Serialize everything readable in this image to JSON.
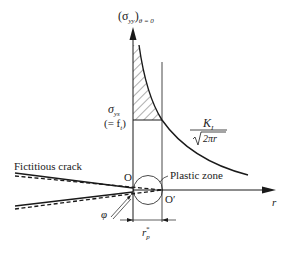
{
  "diagram": {
    "y_axis_label": {
      "main": "(σ",
      "sub_yy": "yy",
      "close": ")",
      "sub_theta": "θ = 0"
    },
    "x_axis_label": "r",
    "yield_stress": {
      "symbol": "σ",
      "sub": "ys",
      "equiv_open": "(= f",
      "equiv_sub": "t",
      "equiv_close": ")"
    },
    "formula": {
      "numerator": "K",
      "numerator_sub": "I",
      "denominator": "2πr"
    },
    "labels": {
      "fictitious_crack": "Fictitious crack",
      "origin": "O",
      "origin_prime": "O′",
      "plastic_zone": "Plastic zone",
      "phi": "φ",
      "rp_main": "r",
      "rp_sub": "p",
      "rp_sup": "*"
    },
    "colors": {
      "line": "#1a1a1a",
      "hatch": "#333333",
      "background": "#ffffff"
    }
  }
}
